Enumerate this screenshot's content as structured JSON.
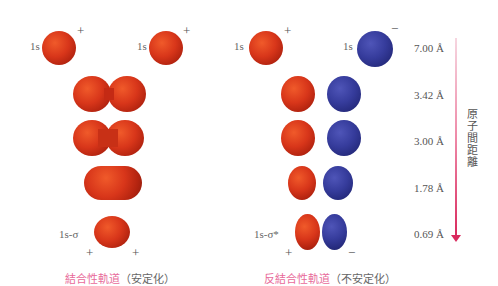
{
  "bonding": {
    "atom_label_left": "1s",
    "atom_label_right": "1s",
    "sign_left": "+",
    "sign_right": "+",
    "mo_label": "1s-σ",
    "mo_sign_left": "+",
    "mo_sign_right": "+",
    "caption_main": "結合性軌道",
    "caption_paren": "（安定化）",
    "color": "#d8361a"
  },
  "antibonding": {
    "atom_label_left": "1s",
    "atom_label_right": "1s",
    "sign_left": "+",
    "sign_right": "−",
    "mo_label": "1s-σ*",
    "mo_sign_left": "+",
    "mo_sign_right": "−",
    "caption_main": "反結合性軌道",
    "caption_paren": "（不安定化）",
    "color_positive": "#d8361a",
    "color_negative": "#363c9c"
  },
  "distances": [
    "7.00 Å",
    "3.42 Å",
    "3.00 Å",
    "1.78 Å",
    "0.69 Å"
  ],
  "axis": {
    "label": "原子間距離",
    "color": "#d92a5e"
  }
}
